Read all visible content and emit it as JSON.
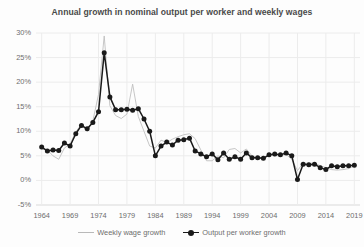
{
  "chart_data": {
    "type": "line",
    "title": "Annual growth in nominal output per worker and weekly wages",
    "xlabel": "",
    "ylabel": "",
    "ylim": [
      -5,
      30
    ],
    "xlim": [
      1963,
      2020
    ],
    "ytick_labels": [
      "30%",
      "25%",
      "20%",
      "15%",
      "10%",
      "5%",
      "0%",
      "-5%"
    ],
    "ytick_values": [
      30,
      25,
      20,
      15,
      10,
      5,
      0,
      -5
    ],
    "xtick_labels": [
      "1964",
      "1969",
      "1974",
      "1979",
      "1984",
      "1989",
      "1994",
      "1999",
      "2004",
      "2009",
      "2014",
      "2019"
    ],
    "xtick_values": [
      1964,
      1969,
      1974,
      1979,
      1984,
      1989,
      1994,
      1999,
      2004,
      2009,
      2014,
      2019
    ],
    "grid": true,
    "legend_position": "bottom",
    "x": [
      1964,
      1965,
      1966,
      1967,
      1968,
      1969,
      1970,
      1971,
      1972,
      1973,
      1974,
      1975,
      1976,
      1977,
      1978,
      1979,
      1980,
      1981,
      1982,
      1983,
      1984,
      1985,
      1986,
      1987,
      1988,
      1989,
      1990,
      1991,
      1992,
      1993,
      1994,
      1995,
      1996,
      1997,
      1998,
      1999,
      2000,
      2001,
      2002,
      2003,
      2004,
      2005,
      2006,
      2007,
      2008,
      2009,
      2010,
      2011,
      2012,
      2013,
      2014,
      2015,
      2016,
      2017,
      2018,
      2019
    ],
    "series": [
      {
        "name": "Weekly wage growth",
        "color": "#bfbfbf",
        "marker": false,
        "values": [
          6.4,
          6.2,
          5.0,
          4.3,
          6.6,
          7.4,
          9.9,
          11.4,
          10.0,
          12.1,
          17.5,
          29.4,
          15.2,
          13.2,
          12.6,
          13.5,
          19.6,
          13.0,
          10.0,
          7.0,
          6.6,
          8.2,
          7.7,
          8.4,
          8.9,
          9.3,
          9.5,
          8.5,
          6.2,
          4.0,
          4.0,
          5.0,
          4.6,
          6.3,
          6.5,
          5.6,
          6.4,
          5.0,
          4.5,
          4.5,
          5.3,
          5.0,
          5.1,
          5.3,
          4.3,
          2.0,
          3.5,
          3.5,
          3.5,
          3.0,
          2.6,
          2.2,
          2.1,
          2.2,
          2.4,
          3.0
        ]
      },
      {
        "name": "Output per worker growth",
        "color": "#1a1a1a",
        "marker": true,
        "values": [
          6.8,
          6.0,
          6.2,
          6.1,
          7.6,
          7.0,
          9.5,
          11.2,
          10.5,
          11.8,
          14.0,
          26.0,
          17.0,
          14.4,
          14.4,
          14.5,
          14.3,
          14.6,
          12.5,
          10.0,
          5.0,
          7.0,
          7.8,
          7.2,
          8.2,
          8.3,
          8.6,
          6.0,
          5.4,
          4.8,
          5.4,
          4.2,
          5.6,
          4.3,
          4.8,
          4.3,
          5.6,
          4.6,
          4.6,
          4.5,
          5.2,
          5.4,
          5.2,
          5.6,
          5.0,
          0.2,
          3.3,
          3.2,
          3.3,
          2.6,
          2.2,
          3.0,
          2.8,
          3.0,
          3.0,
          3.1
        ]
      }
    ]
  },
  "legend": {
    "items": [
      {
        "label": "Weekly wage growth",
        "swatch": "line-swatch-gray"
      },
      {
        "label": "Output per worker growth",
        "swatch": "line-marker-swatch-black"
      }
    ]
  }
}
